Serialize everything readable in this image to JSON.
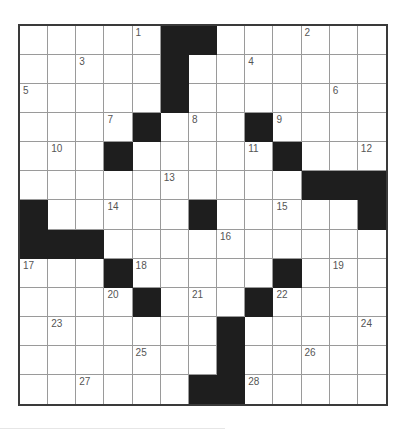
{
  "puzzle": {
    "type": "crossword",
    "rows": 13,
    "cols": 13,
    "colors": {
      "block": "#1e1e1e",
      "border": "#3a3a3a",
      "gridline": "#9a9a9a",
      "number": "#555555",
      "cell": "#ffffff"
    },
    "grid": [
      [
        ".",
        ".",
        ".",
        ".",
        "1",
        "#",
        "#",
        ".",
        ".",
        ".",
        "2",
        ".",
        "."
      ],
      [
        ".",
        ".",
        "3",
        ".",
        ".",
        "#",
        ".",
        ".",
        "4",
        ".",
        ".",
        ".",
        "."
      ],
      [
        "5",
        ".",
        ".",
        ".",
        ".",
        "#",
        ".",
        ".",
        ".",
        ".",
        ".",
        "6",
        "."
      ],
      [
        ".",
        ".",
        ".",
        "7",
        "#",
        ".",
        "8",
        ".",
        "#",
        "9",
        ".",
        ".",
        "."
      ],
      [
        ".",
        "10",
        ".",
        "#",
        ".",
        ".",
        ".",
        ".",
        "11",
        "#",
        ".",
        ".",
        "12"
      ],
      [
        ".",
        ".",
        ".",
        ".",
        ".",
        "13",
        ".",
        ".",
        ".",
        ".",
        "#",
        "#",
        "#"
      ],
      [
        "#",
        ".",
        ".",
        "14",
        ".",
        ".",
        "#",
        ".",
        ".",
        "15",
        ".",
        ".",
        "#"
      ],
      [
        "#",
        "#",
        "#",
        ".",
        ".",
        ".",
        ".",
        "16",
        ".",
        ".",
        ".",
        ".",
        "."
      ],
      [
        "17",
        ".",
        ".",
        "#",
        "18",
        ".",
        ".",
        ".",
        ".",
        "#",
        ".",
        "19",
        "."
      ],
      [
        ".",
        ".",
        ".",
        "20",
        "#",
        ".",
        "21",
        ".",
        "#",
        "22",
        ".",
        ".",
        "."
      ],
      [
        ".",
        "23",
        ".",
        ".",
        ".",
        ".",
        ".",
        "#",
        ".",
        ".",
        ".",
        ".",
        "24"
      ],
      [
        ".",
        ".",
        ".",
        ".",
        "25",
        ".",
        ".",
        "#",
        ".",
        ".",
        "26",
        ".",
        "."
      ],
      [
        ".",
        ".",
        "27",
        ".",
        ".",
        ".",
        "#",
        "#",
        "28",
        ".",
        ".",
        ".",
        "."
      ]
    ],
    "clue_numbers": [
      "1",
      "2",
      "3",
      "4",
      "5",
      "6",
      "7",
      "8",
      "9",
      "10",
      "11",
      "12",
      "13",
      "14",
      "15",
      "16",
      "17",
      "18",
      "19",
      "20",
      "21",
      "22",
      "23",
      "24",
      "25",
      "26",
      "27",
      "28"
    ]
  }
}
